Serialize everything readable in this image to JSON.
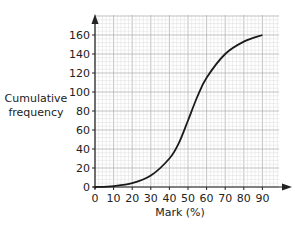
{
  "chart_data": {
    "type": "line",
    "title": "",
    "xlabel": "Mark (%)",
    "ylabel": "Cumulative frequency",
    "xlim": [
      0,
      90
    ],
    "ylim": [
      0,
      160
    ],
    "x_ticks": [
      0,
      10,
      20,
      30,
      40,
      50,
      60,
      70,
      80,
      90
    ],
    "y_ticks": [
      0,
      20,
      40,
      60,
      80,
      100,
      120,
      140,
      160
    ],
    "grid": true,
    "legend": null,
    "series": [
      {
        "name": "cumulative frequency",
        "x": [
          0,
          10,
          20,
          30,
          40,
          45,
          50,
          55,
          60,
          70,
          80,
          90
        ],
        "values": [
          0,
          1,
          4,
          12,
          30,
          46,
          70,
          95,
          115,
          140,
          153,
          160
        ]
      }
    ]
  },
  "labels": {
    "ylabel_line1": "Cumulative",
    "ylabel_line2": "frequency",
    "xlabel": "Mark (%)"
  },
  "colors": {
    "grid_minor": "#dcdcdc",
    "grid_major": "#b4b4b4",
    "axis": "#222222",
    "curve": "#1a1a1a"
  }
}
